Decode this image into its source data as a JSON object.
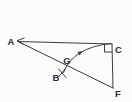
{
  "figure": {
    "background": "#fbfbfb",
    "stroke_color": "#3c3c3c",
    "label_color": "#2e2e2e",
    "labels": [
      {
        "id": "A",
        "text": "A",
        "x": 11,
        "y": 45
      },
      {
        "id": "B",
        "text": "B",
        "x": 56,
        "y": 81
      },
      {
        "id": "C",
        "text": "C",
        "x": 118.5,
        "y": 53
      },
      {
        "id": "F",
        "text": "F",
        "x": 118,
        "y": 97
      },
      {
        "id": "G",
        "text": "G",
        "x": 67,
        "y": 64
      }
    ],
    "segments": [
      {
        "x1": 18,
        "y1": 41.5,
        "x2": 112,
        "y2": 44
      },
      {
        "x1": 18,
        "y1": 41.5,
        "x2": 113,
        "y2": 88
      },
      {
        "x1": 112,
        "y1": 44,
        "x2": 113,
        "y2": 88
      },
      {
        "x1": 58.5,
        "y1": 69,
        "x2": 66,
        "y2": 77.5
      },
      {
        "x1": 65.5,
        "y1": 68.5,
        "x2": 58,
        "y2": 77.5
      }
    ],
    "arrowhead_a_points": "24.5,37.8 17,40.8 24,44.5",
    "right_angle_points": "104.5,44.2 104.5,52 112,52",
    "arc_path": "M 63.5 72.5 Q 73 47.5 110.5 43.5",
    "arc_arrow_points": "82.7,51.1 79.6,55.4 77.5,52"
  }
}
